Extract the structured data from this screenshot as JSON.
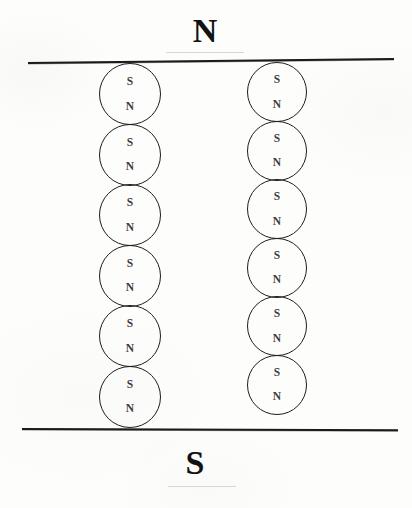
{
  "figure": {
    "background_color": "#fdfdfc",
    "ink_color": "#1b1b1b"
  },
  "poles": {
    "north_label": "N",
    "south_label": "S"
  },
  "rules": {
    "top": {
      "name": "north-pole-face-line"
    },
    "bottom": {
      "name": "south-pole-face-line"
    }
  },
  "chains": [
    {
      "id": "left",
      "count": 6,
      "domains": [
        {
          "top": "S",
          "bottom": "N"
        },
        {
          "top": "S",
          "bottom": "N"
        },
        {
          "top": "S",
          "bottom": "N"
        },
        {
          "top": "S",
          "bottom": "N"
        },
        {
          "top": "S",
          "bottom": "N"
        },
        {
          "top": "S",
          "bottom": "N"
        }
      ]
    },
    {
      "id": "right",
      "count": 6,
      "domains": [
        {
          "top": "S",
          "bottom": "N"
        },
        {
          "top": "S",
          "bottom": "N"
        },
        {
          "top": "S",
          "bottom": "N"
        },
        {
          "top": "S",
          "bottom": "N"
        },
        {
          "top": "S",
          "bottom": "N"
        },
        {
          "top": "S",
          "bottom": "N"
        }
      ]
    }
  ]
}
